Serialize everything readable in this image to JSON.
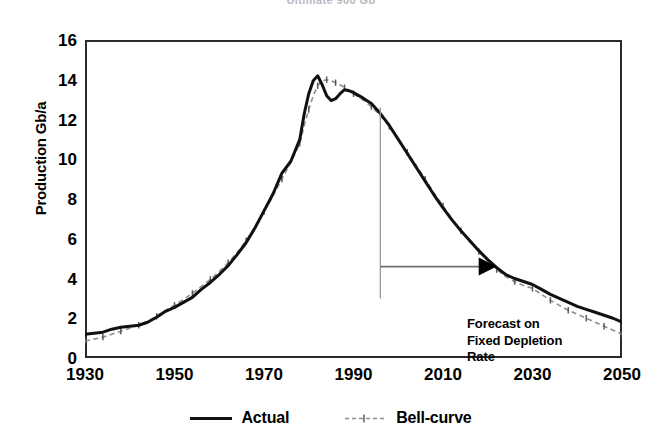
{
  "title": "Ultimate 900 Gb",
  "chart_data": {
    "type": "line",
    "title": "Ultimate 900 Gb",
    "xlabel": "",
    "ylabel": "Production Gb/a",
    "xlim": [
      1930,
      2050
    ],
    "ylim": [
      0,
      16
    ],
    "grid": false,
    "legend_position": "bottom",
    "xticks": [
      "1930",
      "1950",
      "1970",
      "1990",
      "2010",
      "2030",
      "2050"
    ],
    "yticks": [
      "0",
      "2",
      "4",
      "6",
      "8",
      "10",
      "12",
      "14",
      "16"
    ],
    "x": [
      1930,
      1932,
      1934,
      1936,
      1938,
      1940,
      1942,
      1944,
      1946,
      1948,
      1950,
      1952,
      1954,
      1956,
      1958,
      1960,
      1962,
      1964,
      1966,
      1968,
      1970,
      1972,
      1974,
      1976,
      1978,
      1979,
      1980,
      1981,
      1982,
      1983,
      1984,
      1985,
      1986,
      1987,
      1988,
      1989,
      1990,
      1992,
      1994,
      1996,
      1998,
      2000,
      2002,
      2004,
      2006,
      2008,
      2010,
      2012,
      2014,
      2016,
      2018,
      2020,
      2022,
      2024,
      2026,
      2028,
      2030,
      2032,
      2034,
      2036,
      2038,
      2040,
      2042,
      2044,
      2046,
      2048,
      2050
    ],
    "series": [
      {
        "name": "Actual",
        "style": "solid-black",
        "values": [
          1.2,
          1.25,
          1.3,
          1.45,
          1.55,
          1.6,
          1.65,
          1.8,
          2.05,
          2.35,
          2.55,
          2.8,
          3.05,
          3.45,
          3.8,
          4.2,
          4.65,
          5.2,
          5.8,
          6.55,
          7.4,
          8.25,
          9.3,
          9.9,
          11.0,
          12.3,
          13.3,
          13.95,
          14.2,
          13.75,
          13.2,
          12.95,
          13.05,
          13.3,
          13.5,
          13.45,
          13.35,
          13.1,
          12.8,
          12.3,
          11.7,
          11.0,
          10.3,
          9.6,
          8.9,
          8.2,
          7.55,
          6.95,
          6.4,
          5.9,
          5.4,
          4.95,
          4.55,
          4.2,
          4.0,
          3.85,
          3.7,
          3.45,
          3.2,
          3.0,
          2.8,
          2.6,
          2.45,
          2.3,
          2.15,
          2.0,
          1.8
        ]
      },
      {
        "name": "Bell-curve",
        "style": "dashed-gray-cross",
        "values": [
          0.85,
          0.95,
          1.05,
          1.2,
          1.35,
          1.5,
          1.65,
          1.85,
          2.1,
          2.4,
          2.65,
          2.95,
          3.25,
          3.6,
          3.95,
          4.35,
          4.8,
          5.3,
          5.9,
          6.6,
          7.35,
          8.15,
          9.0,
          9.85,
          10.8,
          11.7,
          12.5,
          13.2,
          13.7,
          13.95,
          14.0,
          13.95,
          13.85,
          13.75,
          13.6,
          13.45,
          13.3,
          13.0,
          12.65,
          12.2,
          11.65,
          11.0,
          10.35,
          9.7,
          9.0,
          8.3,
          7.65,
          7.0,
          6.4,
          5.85,
          5.35,
          4.9,
          4.45,
          4.1,
          3.85,
          3.65,
          3.5,
          3.2,
          2.9,
          2.65,
          2.4,
          2.2,
          2.0,
          1.8,
          1.6,
          1.4,
          1.2
        ]
      }
    ],
    "annotations": [
      {
        "id": "forecast-note",
        "lines": [
          "Forecast on",
          "Fixed Depletion",
          "Rate"
        ],
        "marker_year": 1996,
        "arrow_direction": "right",
        "arrow_end_year": 2022
      }
    ],
    "colors": {
      "actual": "#111111",
      "bell_curve": "#8e8e8e",
      "axis": "#2b2b2b",
      "annotation": "#000000",
      "title": "#b9b9bf"
    }
  },
  "annotation": {
    "line1": "Forecast on",
    "line2": "Fixed Depletion",
    "line3": "Rate"
  },
  "legend": {
    "actual": "Actual",
    "bell_curve": "Bell-curve"
  }
}
